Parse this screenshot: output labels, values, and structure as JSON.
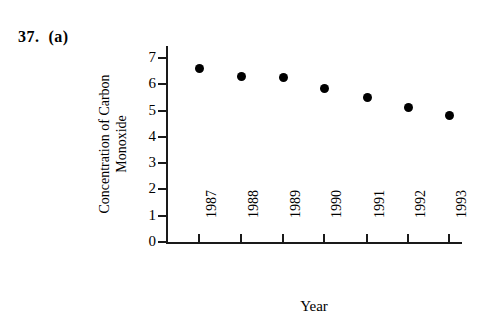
{
  "figure": {
    "problem_label": "37.  (a)"
  },
  "chart_data": {
    "type": "scatter",
    "title": "",
    "xlabel": "Year",
    "ylabel": "Concentration of Carbon Monoxide",
    "ylabel_lines": [
      "Concentration of Carbon",
      "Monoxide"
    ],
    "categories": [
      "1987",
      "1988",
      "1989",
      "1990",
      "1991",
      "1992",
      "1993"
    ],
    "x": [
      1987,
      1988,
      1989,
      1990,
      1991,
      1992,
      1993
    ],
    "values": [
      6.6,
      6.3,
      6.25,
      5.85,
      5.5,
      5.1,
      4.8
    ],
    "ylim": [
      0,
      7.5
    ],
    "ytick_labels": [
      "0",
      "1",
      "2",
      "3",
      "4",
      "5",
      "6",
      "7"
    ],
    "ytick_values": [
      0,
      1,
      2,
      3,
      4,
      5,
      6,
      7
    ],
    "grid": false,
    "legend": false,
    "marker": "filled-circle",
    "marker_color": "#000000",
    "axis_color": "#1a1a1a"
  }
}
